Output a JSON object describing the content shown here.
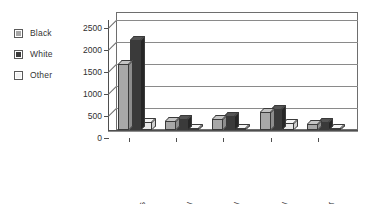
{
  "chart_data": {
    "type": "bar",
    "title": "",
    "subtitle": "",
    "xlabel": "",
    "ylabel": "",
    "categories": [
      "Drugs",
      "Robbery",
      "Property",
      "Fraud/Bribery",
      "White Collar"
    ],
    "series": [
      {
        "name": "Black",
        "color": "#a8a8a8",
        "values": [
          1500,
          200,
          250,
          400,
          130
        ]
      },
      {
        "name": "White",
        "color": "#3a3a3a",
        "values": [
          2050,
          250,
          320,
          480,
          180
        ]
      },
      {
        "name": "Other",
        "color": "#e8e8e8",
        "values": [
          180,
          40,
          45,
          150,
          40
        ]
      }
    ],
    "ylim": [
      0,
      2500
    ],
    "yticks": [
      0,
      500,
      1000,
      1500,
      2000,
      2500
    ],
    "ytick_labels": [
      "0",
      "500",
      "1000",
      "1500",
      "2000",
      "2500"
    ],
    "grid": true,
    "grid_axis": "y",
    "legend_position": "left-outside",
    "style": "3d-column-grayscale"
  },
  "legend": {
    "items": [
      {
        "label": "Black",
        "swatch_icon": "legend-swatch-icon"
      },
      {
        "label": "White",
        "swatch_icon": "legend-swatch-icon"
      },
      {
        "label": "Other",
        "swatch_icon": "legend-swatch-icon"
      }
    ]
  },
  "axes": {
    "y": {
      "tick_labels": [
        "0",
        "500",
        "1000",
        "1500",
        "2000",
        "2500"
      ]
    },
    "x": {
      "tick_labels": [
        "Drugs",
        "Robbery",
        "Property",
        "Fraud/Bribery",
        "White Collar"
      ]
    }
  }
}
